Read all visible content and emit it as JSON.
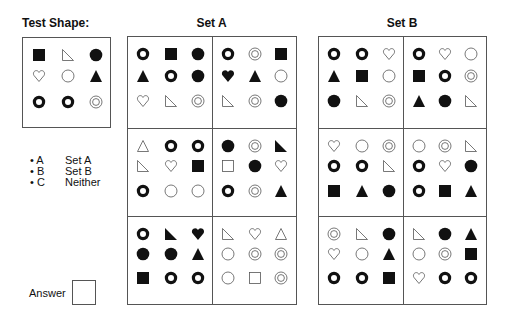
{
  "test_shape": {
    "title": "Test Shape:",
    "grid": [
      [
        "square-filled",
        "rtriangle-outline",
        "circle-filled"
      ],
      [
        "heart-outline",
        "circle-outline",
        "triangle-filled"
      ],
      [
        "ring",
        "ring",
        "double-circle"
      ]
    ]
  },
  "legend": {
    "items": [
      {
        "key": "• A",
        "label": "Set A"
      },
      {
        "key": "• B",
        "label": "Set B"
      },
      {
        "key": "• C",
        "label": "Neither"
      }
    ]
  },
  "answer": {
    "label": "Answer",
    "value": ""
  },
  "set_a": {
    "title": "Set A",
    "panels": [
      [
        [
          "ring",
          "square-filled",
          "circle-filled"
        ],
        [
          "triangle-filled",
          "ring",
          "circle-filled"
        ],
        [
          "heart-outline",
          "rtriangle-outline",
          "double-circle"
        ]
      ],
      [
        [
          "ring",
          "double-circle",
          "square-filled"
        ],
        [
          "heart-filled",
          "triangle-filled",
          "circle-outline"
        ],
        [
          "rtriangle-outline",
          "double-circle",
          "circle-filled"
        ]
      ],
      [
        [
          "triangle-outline",
          "ring",
          "ring"
        ],
        [
          "rtriangle-outline",
          "heart-outline",
          "square-filled"
        ],
        [
          "ring",
          "circle-outline",
          "circle-outline"
        ]
      ],
      [
        [
          "circle-filled",
          "double-circle",
          "rtriangle-filled"
        ],
        [
          "square-outline",
          "circle-filled",
          "heart-outline"
        ],
        [
          "ring",
          "double-circle",
          "triangle-filled"
        ]
      ],
      [
        [
          "ring",
          "rtriangle-filled",
          "heart-filled"
        ],
        [
          "circle-filled",
          "circle-filled",
          "triangle-filled"
        ],
        [
          "square-filled",
          "ring",
          "ring"
        ]
      ],
      [
        [
          "rtriangle-outline",
          "heart-outline",
          "triangle-outline"
        ],
        [
          "circle-outline",
          "double-circle",
          "double-circle"
        ],
        [
          "circle-outline",
          "square-outline",
          "double-circle"
        ]
      ]
    ]
  },
  "set_b": {
    "title": "Set B",
    "panels": [
      [
        [
          "ring",
          "ring",
          "heart-outline"
        ],
        [
          "triangle-filled",
          "square-filled",
          "circle-outline"
        ],
        [
          "circle-filled",
          "rtriangle-outline",
          "double-circle"
        ]
      ],
      [
        [
          "ring",
          "heart-outline",
          "circle-outline"
        ],
        [
          "square-filled",
          "ring",
          "double-circle"
        ],
        [
          "triangle-filled",
          "circle-filled",
          "rtriangle-outline"
        ]
      ],
      [
        [
          "heart-outline",
          "circle-outline",
          "double-circle"
        ],
        [
          "ring",
          "ring",
          "rtriangle-outline"
        ],
        [
          "square-filled",
          "triangle-filled",
          "circle-filled"
        ]
      ],
      [
        [
          "circle-outline",
          "double-circle",
          "rtriangle-outline"
        ],
        [
          "ring",
          "heart-outline",
          "circle-filled"
        ],
        [
          "ring",
          "square-filled",
          "triangle-filled"
        ]
      ],
      [
        [
          "double-circle",
          "rtriangle-outline",
          "circle-filled"
        ],
        [
          "heart-outline",
          "circle-outline",
          "triangle-filled"
        ],
        [
          "ring",
          "ring",
          "square-filled"
        ]
      ],
      [
        [
          "rtriangle-outline",
          "circle-filled",
          "triangle-filled"
        ],
        [
          "circle-outline",
          "double-circle",
          "square-filled"
        ],
        [
          "heart-outline",
          "ring",
          "ring"
        ]
      ]
    ]
  }
}
